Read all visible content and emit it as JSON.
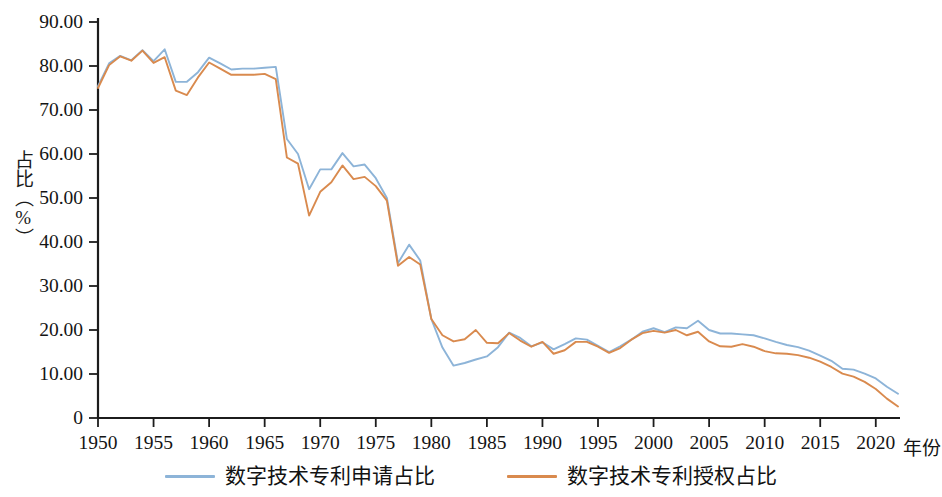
{
  "chart_data": {
    "type": "line",
    "title": "",
    "xlabel": "年份",
    "ylabel": "占比（%）",
    "xlim": [
      1950,
      2022
    ],
    "ylim": [
      0,
      90
    ],
    "grid": false,
    "legend_position": "bottom-center",
    "y_ticks": [
      "0",
      "10.00",
      "20.00",
      "30.00",
      "40.00",
      "50.00",
      "60.00",
      "70.00",
      "80.00",
      "90.00"
    ],
    "y_tick_values": [
      0,
      10,
      20,
      30,
      40,
      50,
      60,
      70,
      80,
      90
    ],
    "x_ticks": [
      "1950",
      "1955",
      "1960",
      "1965",
      "1970",
      "1975",
      "1980",
      "1985",
      "1990",
      "1995",
      "2000",
      "2005",
      "2010",
      "2015",
      "2020"
    ],
    "x_tick_values": [
      1950,
      1955,
      1960,
      1965,
      1970,
      1975,
      1980,
      1985,
      1990,
      1995,
      2000,
      2005,
      2010,
      2015,
      2020
    ],
    "x": [
      1950,
      1951,
      1952,
      1953,
      1954,
      1955,
      1956,
      1957,
      1958,
      1959,
      1960,
      1961,
      1962,
      1963,
      1964,
      1965,
      1966,
      1967,
      1968,
      1969,
      1970,
      1971,
      1972,
      1973,
      1974,
      1975,
      1976,
      1977,
      1978,
      1979,
      1980,
      1981,
      1982,
      1983,
      1984,
      1985,
      1986,
      1987,
      1988,
      1989,
      1990,
      1991,
      1992,
      1993,
      1994,
      1995,
      1996,
      1997,
      1998,
      1999,
      2000,
      2001,
      2002,
      2003,
      2004,
      2005,
      2006,
      2007,
      2008,
      2009,
      2010,
      2011,
      2012,
      2013,
      2014,
      2015,
      2016,
      2017,
      2018,
      2019,
      2020,
      2021,
      2022
    ],
    "series": [
      {
        "name": "数字技术专利申请占比",
        "color": "#8db4d8",
        "values": [
          75.4,
          80.6,
          82.3,
          81.3,
          83.6,
          81.1,
          83.8,
          76.4,
          76.4,
          78.6,
          81.9,
          80.6,
          79.2,
          79.4,
          79.4,
          79.6,
          79.8,
          63.4,
          60.0,
          52.0,
          56.5,
          56.5,
          60.2,
          57.2,
          57.6,
          54.5,
          50.0,
          35.2,
          39.4,
          35.8,
          22.5,
          16.0,
          11.9,
          12.5,
          13.3,
          14.0,
          16.1,
          19.4,
          18.2,
          16.3,
          17.2,
          15.6,
          16.8,
          18.1,
          17.8,
          16.4,
          15.0,
          16.3,
          17.8,
          19.6,
          20.4,
          19.5,
          20.6,
          20.4,
          22.1,
          20.0,
          19.2,
          19.2,
          19.0,
          18.8,
          18.1,
          17.3,
          16.6,
          16.1,
          15.3,
          14.2,
          13.0,
          11.2,
          11.0,
          10.1,
          9.0,
          7.1,
          5.5
        ]
      },
      {
        "name": "数字技术专利授权占比",
        "color": "#d98a4e",
        "values": [
          75.0,
          80.2,
          82.2,
          81.2,
          83.5,
          80.7,
          82.0,
          74.4,
          73.4,
          77.4,
          80.8,
          79.4,
          78.0,
          78.0,
          78.0,
          78.2,
          77.0,
          59.2,
          57.8,
          46.0,
          51.4,
          53.6,
          57.4,
          54.3,
          54.8,
          52.7,
          49.4,
          34.6,
          36.6,
          34.9,
          22.5,
          18.8,
          17.4,
          17.9,
          20.0,
          17.1,
          17.0,
          19.3,
          17.6,
          16.2,
          17.3,
          14.6,
          15.4,
          17.3,
          17.3,
          16.2,
          14.8,
          15.9,
          17.8,
          19.3,
          19.8,
          19.4,
          20.0,
          18.8,
          19.6,
          17.4,
          16.3,
          16.2,
          16.8,
          16.2,
          15.2,
          14.7,
          14.6,
          14.3,
          13.7,
          12.8,
          11.6,
          10.1,
          9.4,
          8.2,
          6.6,
          4.4,
          2.6
        ]
      }
    ]
  },
  "legend": {
    "items": [
      {
        "label": "数字技术专利申请占比",
        "color": "#8db4d8"
      },
      {
        "label": "数字技术专利授权占比",
        "color": "#d98a4e"
      }
    ]
  },
  "axes": {
    "y_axis_title": "占比（%）",
    "x_axis_title": "年份"
  }
}
